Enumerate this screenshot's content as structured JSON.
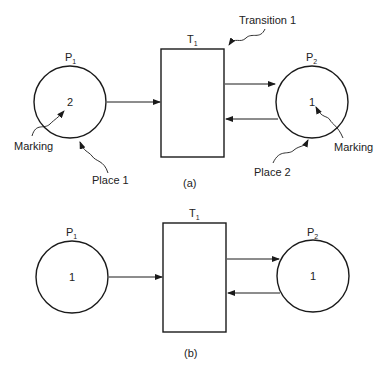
{
  "diagrams": [
    {
      "caption": "(a)",
      "places": [
        {
          "label": "P",
          "sub": "1",
          "tokens": "2"
        },
        {
          "label": "P",
          "sub": "2",
          "tokens": "1"
        }
      ],
      "transition": {
        "label": "T",
        "sub": "1"
      },
      "annotations": {
        "transition": "Transition 1",
        "place1": "Place 1",
        "place2": "Place 2",
        "marking1": "Marking",
        "marking2": "Marking"
      }
    },
    {
      "caption": "(b)",
      "places": [
        {
          "label": "P",
          "sub": "1",
          "tokens": "1"
        },
        {
          "label": "P",
          "sub": "2",
          "tokens": "1"
        }
      ],
      "transition": {
        "label": "T",
        "sub": "1"
      }
    }
  ]
}
